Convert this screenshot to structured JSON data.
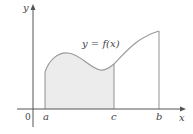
{
  "figure": {
    "type": "area-under-curve-diagram",
    "function_label": "y = f(x)",
    "axes": {
      "x_label": "x",
      "y_label": "y",
      "origin_label": "0"
    },
    "x_markers": [
      {
        "label": "a",
        "x": 45
      },
      {
        "label": "c",
        "x": 114
      },
      {
        "label": "b",
        "x": 159
      }
    ],
    "shaded_region": {
      "from": "a",
      "to": "c"
    },
    "colors": {
      "curve": "#9a9a9a",
      "axes": "#555555",
      "shade": "#ececec",
      "text": "#444444"
    }
  }
}
